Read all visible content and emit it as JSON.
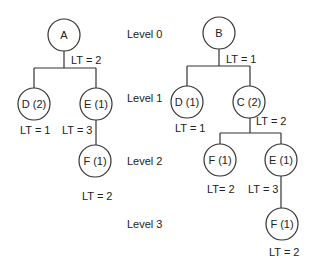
{
  "levels": [
    {
      "label": "Level 0",
      "x": 127,
      "y": 38
    },
    {
      "label": "Level 1",
      "x": 127,
      "y": 102
    },
    {
      "label": "Level 2",
      "x": 127,
      "y": 165
    },
    {
      "label": "Level 3",
      "x": 127,
      "y": 228
    }
  ],
  "trees": [
    {
      "name": "tree-a",
      "nodes": [
        {
          "id": "A",
          "label": "A",
          "cx": 64,
          "cy": 35,
          "r": 16
        },
        {
          "id": "D2",
          "label": "D (2)",
          "cx": 34,
          "cy": 104,
          "r": 16
        },
        {
          "id": "E1",
          "label": "E (1)",
          "cx": 96,
          "cy": 104,
          "r": 16
        },
        {
          "id": "F1",
          "label": "F (1)",
          "cx": 95,
          "cy": 161,
          "r": 16
        }
      ],
      "edges": [
        "M64 51 L64 68",
        "M34 68 L96 68",
        "M34 68 L34 88",
        "M96 68 L96 88",
        "M96 120 L96 145"
      ],
      "lt_labels": [
        {
          "text": "LT =  2",
          "x": 71,
          "y": 64
        },
        {
          "text": "LT =  1",
          "x": 20,
          "y": 134
        },
        {
          "text": "LT =  3",
          "x": 62,
          "y": 134
        },
        {
          "text": "LT =  2",
          "x": 82,
          "y": 200
        }
      ]
    },
    {
      "name": "tree-b",
      "nodes": [
        {
          "id": "B",
          "label": "B",
          "cx": 219,
          "cy": 33,
          "r": 16
        },
        {
          "id": "D1",
          "label": "D (1)",
          "cx": 187,
          "cy": 102,
          "r": 16
        },
        {
          "id": "C2",
          "label": "C (2)",
          "cx": 249,
          "cy": 102,
          "r": 16
        },
        {
          "id": "F1a",
          "label": "F (1)",
          "cx": 220,
          "cy": 160,
          "r": 16
        },
        {
          "id": "E1",
          "label": "E (1)",
          "cx": 281,
          "cy": 160,
          "r": 16
        },
        {
          "id": "F1b",
          "label": "F (1)",
          "cx": 282,
          "cy": 224,
          "r": 16
        }
      ],
      "edges": [
        "M219 49 L219 66",
        "M187 66 L250 66",
        "M187 66 L187 86",
        "M250 66 L250 86",
        "M250 118 L250 133",
        "M220 133 L281 133",
        "M220 133 L220 144",
        "M281 133 L281 144",
        "M281 176 L281 208"
      ],
      "lt_labels": [
        {
          "text": "LT =  1",
          "x": 226,
          "y": 63
        },
        {
          "text": "LT =  1",
          "x": 175,
          "y": 132
        },
        {
          "text": "LT =  2",
          "x": 256,
          "y": 125
        },
        {
          "text": "LT=  2",
          "x": 207,
          "y": 193
        },
        {
          "text": "LT =  3",
          "x": 248,
          "y": 193
        },
        {
          "text": "LT =  2",
          "x": 269,
          "y": 256
        }
      ]
    }
  ]
}
